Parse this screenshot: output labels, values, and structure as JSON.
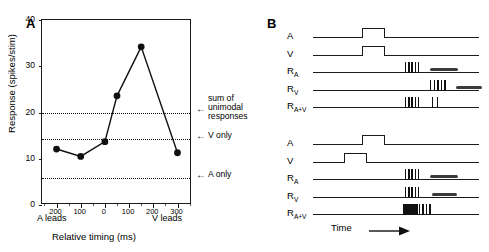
{
  "figure": {
    "panels": [
      {
        "letter": "A"
      },
      {
        "letter": "B"
      }
    ]
  },
  "panelA": {
    "letter": "A",
    "ylabel": "Response (spikes/stim)",
    "xlabel": "Relative timing (ms)",
    "left_lead_label": "A leads",
    "right_lead_label": "V leads",
    "yticks": [
      "0",
      "10",
      "20",
      "30",
      "40"
    ],
    "xticks": [
      "200",
      "100",
      "0",
      "100",
      "200",
      "300"
    ],
    "annotations": [
      {
        "arrow": "←",
        "line1": "sum  of",
        "line2": "unimodal",
        "line3": "responses"
      },
      {
        "arrow": "←",
        "line1": "V only"
      },
      {
        "arrow": "←",
        "line1": "A only"
      }
    ]
  },
  "panelB": {
    "letter": "B",
    "time_label": "Time",
    "row_labels": [
      "A",
      "V",
      "R",
      "R",
      "R"
    ],
    "row_labels_full": [
      "A",
      "V",
      "RA",
      "RV",
      "RA+V"
    ],
    "subscripts": [
      "",
      "",
      "A",
      "V",
      "A+V"
    ],
    "blocks": [
      {
        "name": "synchronous",
        "rows": [
          "A",
          "V",
          "R_A",
          "R_V",
          "R_A+V"
        ]
      },
      {
        "name": "v-leads",
        "rows": [
          "A",
          "V",
          "R_A",
          "R_V",
          "R_A+V"
        ]
      }
    ]
  },
  "chart_data": {
    "type": "line",
    "title": "",
    "xlabel": "Relative timing (ms)",
    "ylabel": "Response (spikes/stim)",
    "xlim": [
      -260,
      360
    ],
    "ylim": [
      0,
      40
    ],
    "xtick_values": [
      -200,
      -100,
      0,
      100,
      200,
      300
    ],
    "xtick_labels": [
      "200",
      "100",
      "0",
      "100",
      "200",
      "300"
    ],
    "ytick_values": [
      0,
      10,
      20,
      30,
      40
    ],
    "ytick_labels": [
      "0",
      "10",
      "20",
      "30",
      "40"
    ],
    "x_axis_left_note": "A leads",
    "x_axis_right_note": "V leads",
    "grid": false,
    "legend": "none",
    "series": [
      {
        "name": "Bimodal response",
        "marker": "filled-circle",
        "x": [
          -200,
          -100,
          0,
          50,
          150,
          300
        ],
        "y": [
          12.1,
          10.5,
          13.7,
          23.6,
          34.2,
          11.3
        ]
      }
    ],
    "reference_lines": [
      {
        "label": "sum of unimodal responses",
        "y": 20.0,
        "style": "dotted"
      },
      {
        "label": "V only",
        "y": 14.2,
        "style": "dotted"
      },
      {
        "label": "A only",
        "y": 5.8,
        "style": "dotted"
      }
    ]
  }
}
